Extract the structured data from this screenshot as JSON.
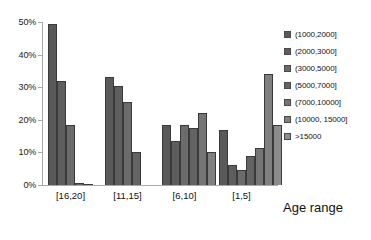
{
  "chart_data": {
    "type": "bar",
    "title": "",
    "xlabel": "Age range",
    "ylabel": "",
    "categories": [
      "[16,20]",
      "[11,15]",
      "[6,10]",
      "[1,5]"
    ],
    "ylim": [
      0,
      50
    ],
    "ytick_labels": [
      "0%",
      "10%",
      "20%",
      "30%",
      "40%",
      "50%"
    ],
    "ytick_values": [
      0,
      10,
      20,
      30,
      40,
      50
    ],
    "grid": false,
    "legend_position": "right",
    "series": [
      {
        "name": "(1000,2000]",
        "color": "#595959",
        "values": [
          49.3,
          33.0,
          18.5,
          17.0
        ]
      },
      {
        "name": "(2000,3000]",
        "color": "#5e5e5e",
        "values": [
          31.8,
          30.5,
          13.5,
          6.0
        ]
      },
      {
        "name": "(3000,5000]",
        "color": "#6b6b6b",
        "values": [
          18.5,
          25.5,
          18.5,
          4.5
        ]
      },
      {
        "name": "(5000,7000]",
        "color": "#636363",
        "values": [
          0.5,
          10.0,
          17.5,
          9.0
        ]
      },
      {
        "name": "(7000,10000]",
        "color": "#757575",
        "values": [
          0.4,
          0.0,
          22.0,
          11.5
        ]
      },
      {
        "name": "(10000, 15000]",
        "color": "#808080",
        "values": [
          0.0,
          0.0,
          10.0,
          34.0
        ]
      },
      {
        "name": ">15000",
        "color": "#8c8c8c",
        "values": [
          0.0,
          0.0,
          0.0,
          18.5
        ]
      }
    ]
  },
  "axis": {
    "x_title": "Age range"
  }
}
